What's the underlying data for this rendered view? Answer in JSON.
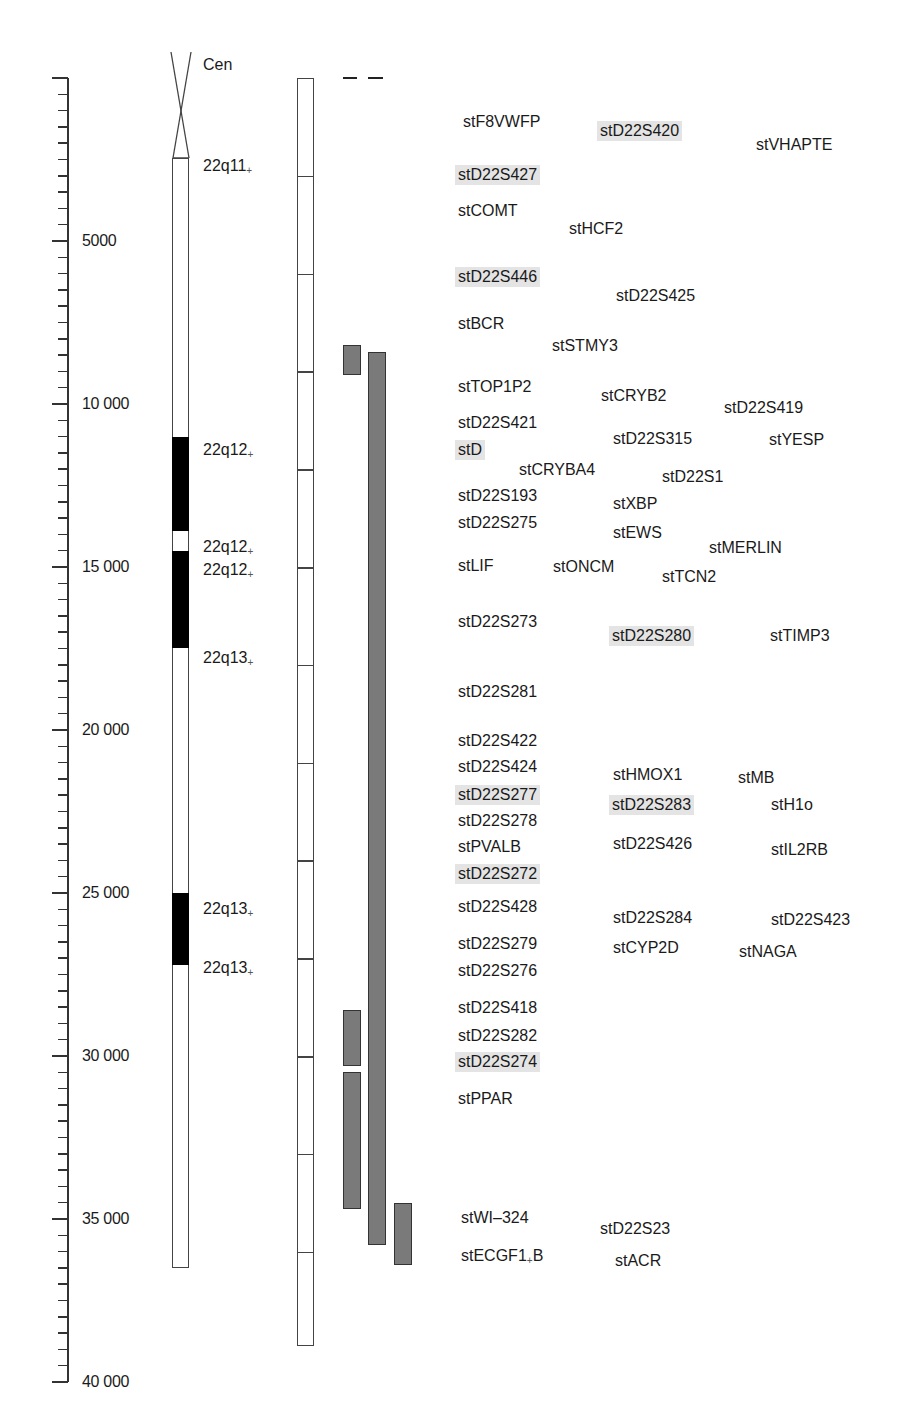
{
  "chart_data": {
    "type": "diagram",
    "title": "",
    "scale": {
      "unit": "kb",
      "range": [
        0,
        40000
      ],
      "minor_tick_step": 500,
      "labels": [
        {
          "value": 5000,
          "label": "5000"
        },
        {
          "value": 10000,
          "label": "10 000"
        },
        {
          "value": 15000,
          "label": "15 000"
        },
        {
          "value": 20000,
          "label": "20 000"
        },
        {
          "value": 25000,
          "label": "25 000"
        },
        {
          "value": 30000,
          "label": "30 000"
        },
        {
          "value": 35000,
          "label": "35 000"
        },
        {
          "value": 40000,
          "label": "40 000"
        }
      ]
    },
    "ideogram": {
      "centromere_label": "Cen",
      "start": -3500,
      "end": 36500,
      "dark_bands": [
        {
          "start": 11000,
          "end": 13900
        },
        {
          "start": 14500,
          "end": 17500
        },
        {
          "start": 25000,
          "end": 27200
        }
      ],
      "band_labels": [
        {
          "text": "22q11",
          "sub": "+",
          "pos": 2700
        },
        {
          "text": "22q12",
          "sub": "+",
          "pos": 11400
        },
        {
          "text": "22q12",
          "sub": "+",
          "pos": 14400
        },
        {
          "text": "22q12",
          "sub": "+",
          "pos": 15100
        },
        {
          "text": "22q13",
          "sub": "+",
          "pos": 17800
        },
        {
          "text": "22q13",
          "sub": "+",
          "pos": 25500
        },
        {
          "text": "22q13",
          "sub": "+",
          "pos": 27300
        }
      ]
    },
    "segment_bar": {
      "start": 0,
      "end": 38900,
      "dividers": [
        3000,
        6000,
        9000,
        12000,
        15000,
        18000,
        21000,
        24000,
        27000,
        30000,
        33000,
        36000
      ]
    },
    "contigs": [
      {
        "col": 0,
        "start": 8200,
        "end": 9100
      },
      {
        "col": 1,
        "start": 8400,
        "end": 35800
      },
      {
        "col": 0,
        "start": 28600,
        "end": 30300
      },
      {
        "col": 0,
        "start": 30500,
        "end": 34700
      },
      {
        "col": 2,
        "start": 34500,
        "end": 36400
      }
    ],
    "markers": [
      {
        "name": "stF8VWFP",
        "x": 460,
        "y": 122,
        "hl": false
      },
      {
        "name": "stD22S420",
        "x": 597,
        "y": 131,
        "hl": true
      },
      {
        "name": "stVHAPTE",
        "x": 753,
        "y": 145,
        "hl": false
      },
      {
        "name": "stD22S427",
        "x": 455,
        "y": 175,
        "hl": true
      },
      {
        "name": "stCOMT",
        "x": 455,
        "y": 211,
        "hl": false
      },
      {
        "name": "stHCF2",
        "x": 566,
        "y": 229,
        "hl": false
      },
      {
        "name": "stD22S446",
        "x": 455,
        "y": 277,
        "hl": true
      },
      {
        "name": "stD22S425",
        "x": 613,
        "y": 296,
        "hl": false
      },
      {
        "name": "stBCR",
        "x": 455,
        "y": 324,
        "hl": false
      },
      {
        "name": "stSTMY3",
        "x": 549,
        "y": 346,
        "hl": false
      },
      {
        "name": "stTOP1P2",
        "x": 455,
        "y": 387,
        "hl": false
      },
      {
        "name": "stCRYB2",
        "x": 598,
        "y": 396,
        "hl": false
      },
      {
        "name": "stD22S419",
        "x": 721,
        "y": 408,
        "hl": false
      },
      {
        "name": "stD22S421",
        "x": 455,
        "y": 423,
        "hl": false
      },
      {
        "name": "stD22S315",
        "x": 610,
        "y": 439,
        "hl": false
      },
      {
        "name": "stYESP",
        "x": 766,
        "y": 440,
        "hl": false
      },
      {
        "name": "stD",
        "x": 455,
        "y": 450,
        "hl": true
      },
      {
        "name": "stCRYBA4",
        "x": 516,
        "y": 470,
        "hl": false
      },
      {
        "name": "stD22S1",
        "x": 659,
        "y": 477,
        "hl": false
      },
      {
        "name": "stD22S193",
        "x": 455,
        "y": 496,
        "hl": false
      },
      {
        "name": "stXBP",
        "x": 610,
        "y": 504,
        "hl": false
      },
      {
        "name": "stD22S275",
        "x": 455,
        "y": 523,
        "hl": false
      },
      {
        "name": "stEWS",
        "x": 610,
        "y": 533,
        "hl": false
      },
      {
        "name": "stMERLIN",
        "x": 706,
        "y": 548,
        "hl": false
      },
      {
        "name": "stLIF",
        "x": 455,
        "y": 566,
        "hl": false
      },
      {
        "name": "stONCM",
        "x": 550,
        "y": 567,
        "hl": false
      },
      {
        "name": "stTCN2",
        "x": 659,
        "y": 577,
        "hl": false
      },
      {
        "name": "stD22S273",
        "x": 455,
        "y": 622,
        "hl": false
      },
      {
        "name": "stD22S280",
        "x": 609,
        "y": 636,
        "hl": true
      },
      {
        "name": "stTIMP3",
        "x": 767,
        "y": 636,
        "hl": false
      },
      {
        "name": "stD22S281",
        "x": 455,
        "y": 692,
        "hl": false
      },
      {
        "name": "stD22S422",
        "x": 455,
        "y": 741,
        "hl": false
      },
      {
        "name": "stD22S424",
        "x": 455,
        "y": 767,
        "hl": false
      },
      {
        "name": "stHMOX1",
        "x": 610,
        "y": 775,
        "hl": false
      },
      {
        "name": "stMB",
        "x": 735,
        "y": 778,
        "hl": false
      },
      {
        "name": "stD22S277",
        "x": 455,
        "y": 795,
        "hl": true
      },
      {
        "name": "stD22S283",
        "x": 609,
        "y": 805,
        "hl": true
      },
      {
        "name": "stH1o",
        "x": 768,
        "y": 805,
        "hl": false
      },
      {
        "name": "stD22S278",
        "x": 455,
        "y": 821,
        "hl": false
      },
      {
        "name": "stPVALB",
        "x": 455,
        "y": 847,
        "hl": false
      },
      {
        "name": "stD22S426",
        "x": 610,
        "y": 844,
        "hl": false
      },
      {
        "name": "stIL2RB",
        "x": 768,
        "y": 850,
        "hl": false
      },
      {
        "name": "stD22S272",
        "x": 455,
        "y": 874,
        "hl": true
      },
      {
        "name": "stD22S428",
        "x": 455,
        "y": 907,
        "hl": false
      },
      {
        "name": "stD22S284",
        "x": 610,
        "y": 918,
        "hl": false
      },
      {
        "name": "stD22S423",
        "x": 768,
        "y": 920,
        "hl": false
      },
      {
        "name": "stD22S279",
        "x": 455,
        "y": 944,
        "hl": false
      },
      {
        "name": "stCYP2D",
        "x": 610,
        "y": 948,
        "hl": false
      },
      {
        "name": "stNAGA",
        "x": 736,
        "y": 952,
        "hl": false
      },
      {
        "name": "stD22S276",
        "x": 455,
        "y": 971,
        "hl": false
      },
      {
        "name": "stD22S418",
        "x": 455,
        "y": 1008,
        "hl": false
      },
      {
        "name": "stD22S282",
        "x": 455,
        "y": 1036,
        "hl": false
      },
      {
        "name": "stD22S274",
        "x": 455,
        "y": 1062,
        "hl": true
      },
      {
        "name": "stPPAR",
        "x": 455,
        "y": 1099,
        "hl": false
      },
      {
        "name": "stWI–324",
        "x": 458,
        "y": 1218,
        "hl": false
      },
      {
        "name": "stD22S23",
        "x": 597,
        "y": 1229,
        "hl": false
      },
      {
        "name": "stECGF1",
        "x": 458,
        "y": 1256,
        "hl": false,
        "sub": "+",
        "suffix": "B"
      },
      {
        "name": "stACR",
        "x": 612,
        "y": 1261,
        "hl": false
      }
    ]
  },
  "labels": {
    "cen": "Cen",
    "scale": [
      "5000",
      "10 000",
      "15 000",
      "20 000",
      "25 000",
      "30 000",
      "35 000",
      "40 000"
    ],
    "bands": [
      {
        "text": "22q11",
        "sub": "+"
      },
      {
        "text": "22q12",
        "sub": "+"
      },
      {
        "text": "22q12",
        "sub": "+"
      },
      {
        "text": "22q12",
        "sub": "+"
      },
      {
        "text": "22q13",
        "sub": "+"
      },
      {
        "text": "22q13",
        "sub": "+"
      },
      {
        "text": "22q13",
        "sub": "+"
      }
    ]
  }
}
